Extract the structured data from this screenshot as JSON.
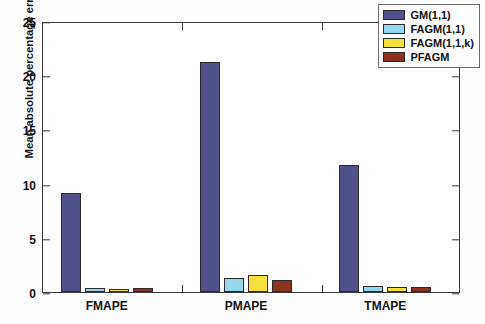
{
  "chart_data": {
    "type": "bar",
    "title": "",
    "subtitle": "",
    "xlabel": "",
    "ylabel": "Mean absolute percentage error(%)",
    "categories": [
      "FMAPE",
      "PMAPE",
      "TMAPE"
    ],
    "series": [
      {
        "name": "GM(1,1)",
        "color": "#50508c",
        "values": [
          9.1,
          21.2,
          11.7
        ]
      },
      {
        "name": "FAGM(1,1)",
        "color": "#96d7f0",
        "values": [
          0.35,
          1.3,
          0.55
        ]
      },
      {
        "name": "FAGM(1,1,k)",
        "color": "#f5e13c",
        "values": [
          0.3,
          1.6,
          0.5
        ]
      },
      {
        "name": "PFAGM",
        "color": "#8b3320",
        "values": [
          0.35,
          1.1,
          0.45
        ]
      }
    ],
    "ylim": [
      0,
      25
    ],
    "ytick_values": [
      0,
      5,
      10,
      15,
      20,
      25
    ],
    "ytick_labels": [
      "0",
      "5",
      "10",
      "15",
      "20",
      "25"
    ],
    "grid": false,
    "legend_position": "top-right",
    "legend_entries": [
      "GM(1,1)",
      "FAGM(1,1)",
      "FAGM(1,1,k)",
      "PFAGM"
    ],
    "annotations": []
  },
  "axes": {
    "y_axis_title": "Mean absolute percentage error(%)"
  }
}
